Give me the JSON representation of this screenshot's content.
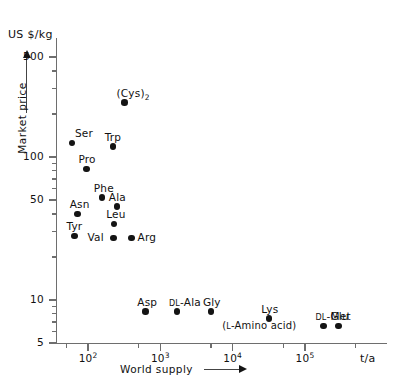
{
  "chart_data": {
    "type": "scatter",
    "title": "",
    "xlabel": "World supply",
    "ylabel": "Market price",
    "x_unit": "t/a",
    "y_unit": "US $/kg",
    "xscale": "log",
    "yscale": "log",
    "xlim": [
      40,
      400000
    ],
    "ylim": [
      5,
      700
    ],
    "grid": false,
    "legend": null,
    "x_tick_labels": [
      "10",
      "10",
      "10",
      "10"
    ],
    "x_tick_exponents": [
      "2",
      "3",
      "4",
      "5"
    ],
    "x_tick_values": [
      100,
      1000,
      10000,
      100000
    ],
    "y_tick_labels": [
      "500",
      "100",
      "50",
      "10",
      "5"
    ],
    "y_tick_values": [
      500,
      100,
      50,
      10,
      5
    ],
    "annotations": [
      {
        "text": "(L-Amino acid)",
        "x": 30000,
        "y": 6.6
      }
    ],
    "points": [
      {
        "label": "Ser",
        "x": 60,
        "y": 125,
        "label_pos": "above-right"
      },
      {
        "label": "(Cys)2",
        "x": 320,
        "y": 240,
        "label_pos": "above"
      },
      {
        "label": "Trp",
        "x": 220,
        "y": 118,
        "label_pos": "above"
      },
      {
        "label": "Pro",
        "x": 95,
        "y": 82,
        "label_pos": "above"
      },
      {
        "label": "Phe",
        "x": 155,
        "y": 52,
        "label_pos": "above"
      },
      {
        "label": "Ala",
        "x": 250,
        "y": 45,
        "label_pos": "above"
      },
      {
        "label": "Asn",
        "x": 72,
        "y": 40,
        "label_pos": "above"
      },
      {
        "label": "Leu",
        "x": 230,
        "y": 34,
        "label_pos": "above"
      },
      {
        "label": "Tyr",
        "x": 65,
        "y": 28,
        "label_pos": "above"
      },
      {
        "label": "Val",
        "x": 225,
        "y": 27,
        "label_pos": "left"
      },
      {
        "label": "Arg",
        "x": 400,
        "y": 27,
        "label_pos": "right"
      },
      {
        "label": "Asp",
        "x": 620,
        "y": 8.3,
        "label_pos": "above"
      },
      {
        "label": "DL-Ala",
        "x": 1700,
        "y": 8.3,
        "label_pos": "above"
      },
      {
        "label": "Gly",
        "x": 5000,
        "y": 8.3,
        "label_pos": "above"
      },
      {
        "label": "Lys",
        "x": 32000,
        "y": 7.4,
        "label_pos": "above"
      },
      {
        "label": "DL-Met",
        "x": 180000,
        "y": 6.6,
        "label_pos": "above"
      },
      {
        "label": "Glu",
        "x": 290000,
        "y": 6.6,
        "label_pos": "above"
      }
    ]
  },
  "labels": {
    "y_unit": "US $/kg",
    "y_title": "Market price",
    "x_title": "World supply",
    "x_unit": "t/a",
    "annotation_l_amino": "(L-Amino acid)",
    "y_ticks": [
      "500",
      "100",
      "50",
      "10",
      "5"
    ],
    "points": [
      {
        "text": "Ser",
        "sub": ""
      },
      {
        "text": "(Cys)",
        "sub": "2"
      },
      {
        "text": "Trp",
        "sub": ""
      },
      {
        "text": "Pro",
        "sub": ""
      },
      {
        "text": "Phe",
        "sub": ""
      },
      {
        "text": "Ala",
        "sub": ""
      },
      {
        "text": "Asn",
        "sub": ""
      },
      {
        "text": "Leu",
        "sub": ""
      },
      {
        "text": "Tyr",
        "sub": ""
      },
      {
        "text": "Val",
        "sub": ""
      },
      {
        "text": "Arg",
        "sub": ""
      },
      {
        "text": "Asp",
        "sub": ""
      },
      {
        "text": "DL-Ala",
        "sub": "",
        "smallcaps_prefix": "DL"
      },
      {
        "text": "Gly",
        "sub": ""
      },
      {
        "text": "Lys",
        "sub": ""
      },
      {
        "text": "DL-Met",
        "sub": "",
        "smallcaps_prefix": "DL"
      },
      {
        "text": "Glu",
        "sub": ""
      }
    ]
  },
  "colors": {
    "axis": "#6e6e6e",
    "marker": "#141414",
    "text": "#111111",
    "background": "#ffffff"
  }
}
